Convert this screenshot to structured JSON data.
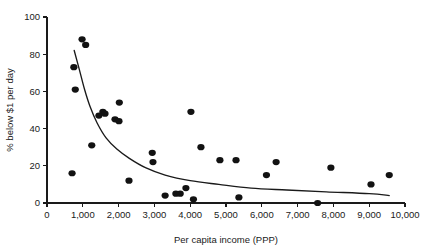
{
  "chart_data": {
    "type": "scatter",
    "title": "",
    "xlabel": "Per capita income (PPP)",
    "ylabel": "% below $1 per day",
    "xlim": [
      0,
      10000
    ],
    "ylim": [
      0,
      100
    ],
    "grid": false,
    "legend": null,
    "xticks": [
      0,
      1000,
      2000,
      3000,
      4000,
      5000,
      6000,
      7000,
      8000,
      9000,
      10000
    ],
    "xtick_labels": [
      "0",
      "1,000",
      "2,000",
      "3,000",
      "4,000",
      "5,000",
      "6,000",
      "7,000",
      "8,000",
      "9,000",
      "10,000"
    ],
    "yticks": [
      0,
      20,
      40,
      60,
      80,
      100
    ],
    "ytick_labels": [
      "0",
      "20",
      "40",
      "60",
      "80",
      "100"
    ],
    "marker": "filled-circle",
    "marker_color": "#121212",
    "points": [
      {
        "x": 700,
        "y": 16
      },
      {
        "x": 750,
        "y": 73
      },
      {
        "x": 790,
        "y": 61
      },
      {
        "x": 980,
        "y": 88
      },
      {
        "x": 1080,
        "y": 85
      },
      {
        "x": 1250,
        "y": 31
      },
      {
        "x": 1450,
        "y": 47
      },
      {
        "x": 1560,
        "y": 49
      },
      {
        "x": 1620,
        "y": 48
      },
      {
        "x": 1900,
        "y": 45
      },
      {
        "x": 2010,
        "y": 44
      },
      {
        "x": 2020,
        "y": 54
      },
      {
        "x": 2290,
        "y": 12
      },
      {
        "x": 2940,
        "y": 27
      },
      {
        "x": 2960,
        "y": 22
      },
      {
        "x": 3300,
        "y": 4
      },
      {
        "x": 3600,
        "y": 5
      },
      {
        "x": 3720,
        "y": 5
      },
      {
        "x": 3880,
        "y": 8
      },
      {
        "x": 4020,
        "y": 49
      },
      {
        "x": 4090,
        "y": 2
      },
      {
        "x": 4300,
        "y": 30
      },
      {
        "x": 4830,
        "y": 23
      },
      {
        "x": 5280,
        "y": 23
      },
      {
        "x": 5360,
        "y": 3
      },
      {
        "x": 6130,
        "y": 15
      },
      {
        "x": 6400,
        "y": 22
      },
      {
        "x": 7560,
        "y": 0
      },
      {
        "x": 7930,
        "y": 19
      },
      {
        "x": 9050,
        "y": 10
      },
      {
        "x": 9560,
        "y": 15
      }
    ],
    "trend_line": {
      "name": "fitted curve",
      "color": "#1a1a1a",
      "points": [
        {
          "x": 760,
          "y": 82
        },
        {
          "x": 900,
          "y": 72
        },
        {
          "x": 1050,
          "y": 61
        },
        {
          "x": 1200,
          "y": 52
        },
        {
          "x": 1400,
          "y": 43
        },
        {
          "x": 1650,
          "y": 35
        },
        {
          "x": 1950,
          "y": 29
        },
        {
          "x": 2300,
          "y": 24
        },
        {
          "x": 2750,
          "y": 19
        },
        {
          "x": 3300,
          "y": 15
        },
        {
          "x": 4000,
          "y": 12
        },
        {
          "x": 4800,
          "y": 10
        },
        {
          "x": 5700,
          "y": 8
        },
        {
          "x": 6700,
          "y": 7
        },
        {
          "x": 7800,
          "y": 6
        },
        {
          "x": 9000,
          "y": 5
        },
        {
          "x": 9560,
          "y": 4
        }
      ]
    }
  },
  "axes": {
    "x_title": "Per capita income (PPP)",
    "y_title": "% below $1 per day"
  }
}
